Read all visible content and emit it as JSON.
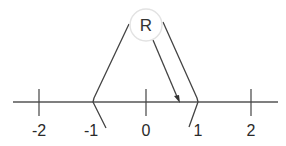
{
  "diagram": {
    "type": "number-line",
    "node": {
      "label": "R",
      "circle_fill": "#ffffff",
      "circle_stroke": "#e0e0e0"
    },
    "ticks": [
      {
        "value": -2,
        "label": "-2",
        "x": 39
      },
      {
        "value": -1,
        "label": "-1",
        "x": 93
      },
      {
        "value": 0,
        "label": "0",
        "x": 146
      },
      {
        "value": 1,
        "label": "1",
        "x": 198
      },
      {
        "value": 2,
        "label": "2",
        "x": 251
      }
    ],
    "bracket": {
      "left": -1,
      "right": 1
    },
    "arrow": {
      "from": "R",
      "to_approx": 0.6
    },
    "colors": {
      "line": "#3a3a3a",
      "text": "#2a2a2a"
    }
  }
}
